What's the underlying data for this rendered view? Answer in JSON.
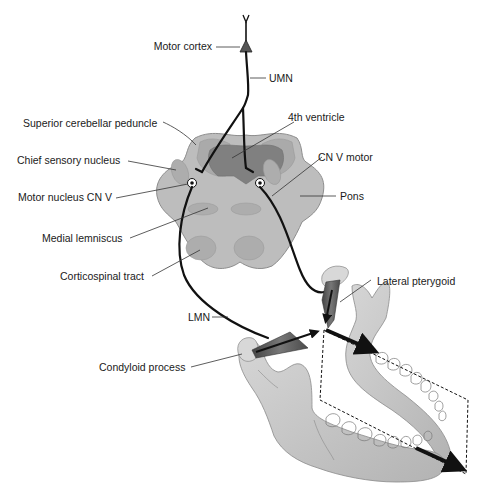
{
  "diagram": {
    "type": "anatomical",
    "colors": {
      "pons_fill": "#bdbdbd",
      "pons_outline": "#8a8a8a",
      "ventricle_fill": "#7f7f7f",
      "peduncle_fill": "#a9a9a9",
      "tract_fill": "#ababab",
      "bone_fill": "#c8c8c8",
      "muscle_fill": "#5a5a5a",
      "nerve": "#111111",
      "background": "#ffffff"
    },
    "labels": {
      "motor_cortex": "Motor cortex",
      "umn": "UMN",
      "superior_cerebellar_peduncle": "Superior cerebellar peduncle",
      "fourth_ventricle": "4th ventricle",
      "chief_sensory_nucleus": "Chief sensory nucleus",
      "cn_v_motor": "CN V motor",
      "motor_nucleus_cn_v": "Motor nucleus CN V",
      "pons": "Pons",
      "medial_lemniscus": "Medial lemniscus",
      "corticospinal_tract": "Corticospinal tract",
      "lateral_pterygoid": "Lateral pterygoid",
      "lmn": "LMN",
      "condyloid_process": "Condyloid process"
    }
  }
}
